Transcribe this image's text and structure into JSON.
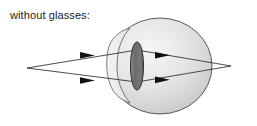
{
  "figure": {
    "caption": "without glasses:",
    "background_color": "#ffffff",
    "ink_color": "#1b1b1b",
    "width": 257,
    "height": 126
  },
  "diagram": {
    "type": "optics-ray-diagram",
    "eye": {
      "label": "eyeball",
      "center_x": 160,
      "center_y": 66,
      "radius_x": 52,
      "radius_y": 48,
      "fill_light": "#f2f2f2",
      "fill_mid": "#d9d9d9",
      "fill_dark": "#bdbdbd",
      "outline_color": "#4a4a4a"
    },
    "cornea": {
      "label": "cornea-bulge",
      "fill": "#ededed",
      "outline_color": "#5a5a5a"
    },
    "lens": {
      "label": "crystalline-lens",
      "center_x": 137,
      "center_y": 66,
      "radius_x": 6.5,
      "radius_y": 24,
      "fill": "#6e6e6e",
      "outline_color": "#2b2b2b"
    },
    "object_point": {
      "label": "object-point",
      "x": 27,
      "y": 68
    },
    "focus_point": {
      "label": "focal-point-behind-retina",
      "x": 231,
      "y": 66
    },
    "rays": [
      {
        "name": "upper-ray",
        "from_x": 27,
        "from_y": 68,
        "to_x": 231,
        "to_y": 66,
        "via_x": 137,
        "via_y": 50,
        "arrows": [
          {
            "x": 90,
            "y": 55
          },
          {
            "x": 165,
            "y": 55
          }
        ]
      },
      {
        "name": "lower-ray",
        "from_x": 27,
        "from_y": 68,
        "to_x": 231,
        "to_y": 66,
        "via_x": 137,
        "via_y": 82,
        "arrows": [
          {
            "x": 90,
            "y": 80
          },
          {
            "x": 165,
            "y": 80
          }
        ]
      }
    ],
    "ray_color": "#1f1f1f",
    "arrow_color": "#101010"
  }
}
